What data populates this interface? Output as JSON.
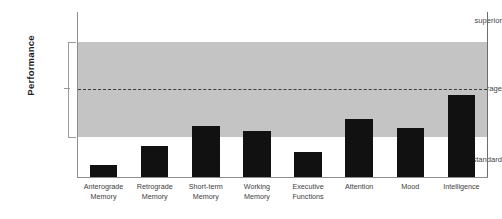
{
  "chart_data": {
    "type": "bar",
    "title": "",
    "xlabel": "",
    "ylabel": "Performance",
    "categories": [
      "Anterograde Memory",
      "Retrograde Memory",
      "Short-term Memory",
      "Working Memory",
      "Executive Functions",
      "Attention",
      "Mood",
      "Intelligence"
    ],
    "category_lines": [
      [
        "Anterograde",
        "Memory"
      ],
      [
        "Retrograde",
        "Memory"
      ],
      [
        "Short-term",
        "Memory"
      ],
      [
        "Working",
        "Memory"
      ],
      [
        "Executive",
        "Functions"
      ],
      [
        "Attention",
        ""
      ],
      [
        "Mood",
        ""
      ],
      [
        "Intelligence",
        ""
      ]
    ],
    "values": [
      7,
      19,
      31,
      28,
      15,
      35,
      30,
      50
    ],
    "ylim": [
      0,
      100
    ],
    "ytick_labels": [
      "superior",
      "average",
      "substandard"
    ],
    "ytick_values": [
      94,
      53,
      10
    ],
    "grid": false,
    "legend": false,
    "annotations": [
      {
        "name": "average-band",
        "type": "shaded-region",
        "y_from": 24,
        "y_to": 82,
        "color": "#c4c4c4"
      },
      {
        "name": "average-reference-line",
        "type": "dashed-line",
        "y": 53,
        "color": "#3b3b3b"
      }
    ],
    "bar_color": "#111111"
  },
  "axes": {
    "y_title": "Performance",
    "y_ticks": [
      {
        "label": "superior"
      },
      {
        "label": "average"
      },
      {
        "label": "substandard"
      }
    ]
  },
  "colors": {
    "bar": "#111111",
    "band": "#c4c4c4",
    "axis": "#8d8d8d",
    "dashed_line": "#3b3b3b",
    "background": "#ffffff"
  }
}
